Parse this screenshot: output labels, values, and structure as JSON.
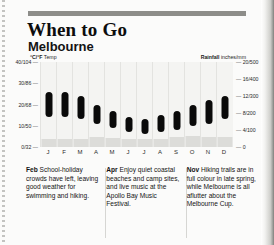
{
  "header": {
    "title": "When to Go",
    "subtitle": "Melbourne"
  },
  "axes": {
    "left_caption_bold": "°C/°F",
    "left_caption_rest": " Temp",
    "right_caption_bold": "Rainfall",
    "right_caption_rest": " inches/mm"
  },
  "chart_data": {
    "type": "bar",
    "subtitle": "Melbourne",
    "categories": [
      "J",
      "F",
      "M",
      "A",
      "M",
      "J",
      "J",
      "A",
      "S",
      "O",
      "N",
      "D"
    ],
    "month_names": [
      "January",
      "February",
      "March",
      "April",
      "May",
      "June",
      "July",
      "August",
      "September",
      "October",
      "November",
      "December"
    ],
    "xlabel": "",
    "ylabel": "°C/°F Temp",
    "y2label": "Rainfall inches/mm",
    "ylim": [
      0,
      40
    ],
    "y2lim": [
      0,
      20
    ],
    "grid": false,
    "legend": "none",
    "left_ticks": [
      "40/104",
      "30/86",
      "20/68",
      "10/50",
      "0/32"
    ],
    "left_tick_values": [
      40,
      30,
      20,
      10,
      0
    ],
    "right_ticks": [
      "20/500",
      "16/400",
      "12/300",
      "8/200",
      "4/100",
      "0"
    ],
    "right_tick_values": [
      20,
      16,
      12,
      8,
      4,
      0
    ],
    "series": [
      {
        "name": "Temperature range (°C)",
        "type": "range-bar",
        "color": "#0a0a0a",
        "high": [
          26,
          26,
          24,
          20,
          17,
          14,
          13,
          15,
          17,
          20,
          22,
          24
        ],
        "low": [
          14,
          14,
          13,
          11,
          9,
          7,
          6,
          7,
          8,
          10,
          11,
          13
        ]
      },
      {
        "name": "Rainfall (inches)",
        "type": "bar",
        "color": "#dcdcd9",
        "values": [
          1.9,
          1.8,
          2.0,
          2.3,
          2.2,
          2.0,
          1.9,
          2.0,
          2.3,
          2.6,
          2.4,
          2.3
        ]
      }
    ]
  },
  "notes": [
    {
      "month": "Feb",
      "text": " School-holiday crowds have left, leaving good weather for swimming and hiking."
    },
    {
      "month": "Apr",
      "text": " Enjoy quiet coastal beaches and camp sites, and live music at the Apollo Bay Music Festival."
    },
    {
      "month": "Nov",
      "text": " Hiking trails are in full colour in late spring, while Melbourne is all aflutter about the Melbourne Cup."
    }
  ]
}
